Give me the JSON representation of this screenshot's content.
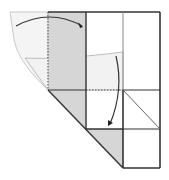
{
  "diagram": {
    "type": "origami-folding-step",
    "colors": {
      "paper_white": "#ffffff",
      "paper_colored": "#d6d6d6",
      "ghost_flap": "#f0f0f0",
      "line": "#222222",
      "light_line": "#999999",
      "arrow": "#333333"
    },
    "elements": [
      {
        "name": "ghost-flap",
        "desc": "translucent folded flap outline at upper left"
      },
      {
        "name": "gray-strip",
        "desc": "shaded colored side of paper left column"
      },
      {
        "name": "grid",
        "desc": "square grid of crease lines"
      },
      {
        "name": "valley-fold-lines",
        "desc": "dotted fold lines"
      },
      {
        "name": "fold-arrow-top",
        "desc": "curved arrow folding flap right"
      },
      {
        "name": "fold-arrow-down",
        "desc": "curved arrow folding flap down"
      },
      {
        "name": "bottom-gray-triangle",
        "desc": "shaded triangle at bottom"
      }
    ]
  }
}
